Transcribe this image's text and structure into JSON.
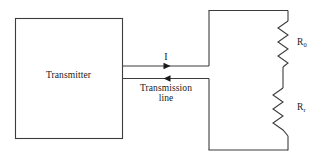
{
  "diagram": {
    "stroke_color": "#3c3c3c",
    "text_color": "#1a1a1a",
    "background": "#ffffff",
    "transmitter": {
      "label": "Transmitter"
    },
    "current": {
      "label": "I"
    },
    "transmission_line": {
      "label_line1": "Transmission",
      "label_line2": "line"
    },
    "resistors": [
      {
        "name": "output-resistor",
        "base": "R",
        "subscript": "0"
      },
      {
        "name": "load-resistor",
        "base": "R",
        "subscript": "r"
      }
    ]
  }
}
